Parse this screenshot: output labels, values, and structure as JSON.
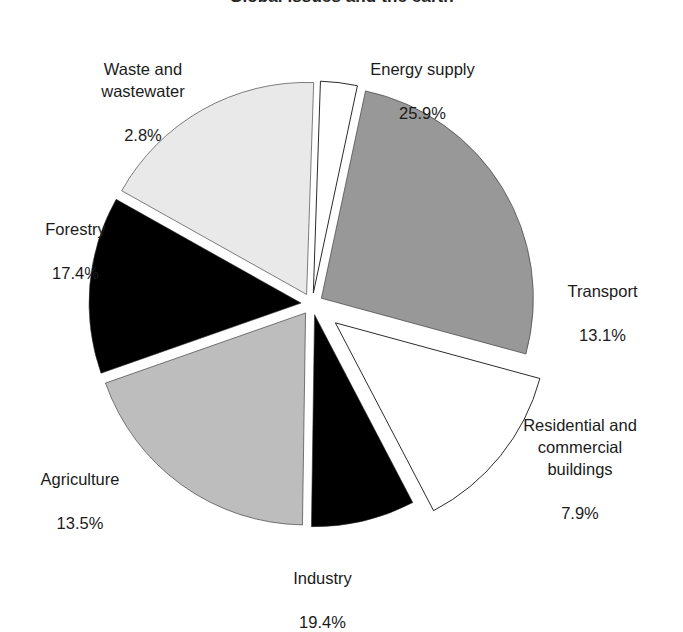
{
  "chart_data": {
    "type": "pie",
    "title": "Global issues and the earth",
    "labels": [
      "Energy supply",
      "Transport",
      "Residential and commercial buildings",
      "Industry",
      "Agriculture",
      "Forestry",
      "Waste and wastewater"
    ],
    "values": [
      25.9,
      13.1,
      7.9,
      19.4,
      13.5,
      17.4,
      2.8
    ],
    "value_labels": [
      "25.9%",
      "13.1%",
      "7.9%",
      "19.4%",
      "13.5%",
      "17.4%",
      "2.8%"
    ],
    "colors": [
      "#989898",
      "#ffffff",
      "#000000",
      "#bdbdbd",
      "#000000",
      "#e9e9e9",
      "#ffffff"
    ],
    "slice_stroke": "#2b2b2b",
    "exploded": true,
    "legend": "none",
    "grid": false,
    "start_angle_deg": -78,
    "direction": "clockwise",
    "units": "percent of total",
    "xlabel": "",
    "ylabel": ""
  },
  "chart": {
    "title": "Global issues and the earth",
    "slices": [
      {
        "key": "energy",
        "name": "Energy supply",
        "value_label": "25.9%",
        "value": 25.9,
        "color": "#989898"
      },
      {
        "key": "transport",
        "name": "Transport",
        "value_label": "13.1%",
        "value": 13.1,
        "color": "#ffffff"
      },
      {
        "key": "residential",
        "name": "Residential and\ncommercial\nbuildings",
        "value_label": "7.9%",
        "value": 7.9,
        "color": "#000000"
      },
      {
        "key": "industry",
        "name": "Industry",
        "value_label": "19.4%",
        "value": 19.4,
        "color": "#bdbdbd"
      },
      {
        "key": "agriculture",
        "name": "Agriculture",
        "value_label": "13.5%",
        "value": 13.5,
        "color": "#000000"
      },
      {
        "key": "forestry",
        "name": "Forestry",
        "value_label": "17.4%",
        "value": 17.4,
        "color": "#e9e9e9"
      },
      {
        "key": "waste",
        "name": "Waste and\nwastewater",
        "value_label": "2.8%",
        "value": 2.8,
        "color": "#ffffff"
      }
    ]
  }
}
